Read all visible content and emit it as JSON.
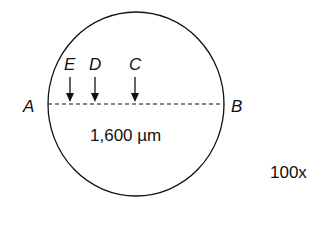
{
  "diagram": {
    "points": {
      "A": "A",
      "B": "B",
      "C": "C",
      "D": "D",
      "E": "E"
    },
    "diameter_label": "1,600 µm",
    "magnification": "100x",
    "colors": {
      "stroke": "#111111",
      "background": "#ffffff"
    }
  }
}
